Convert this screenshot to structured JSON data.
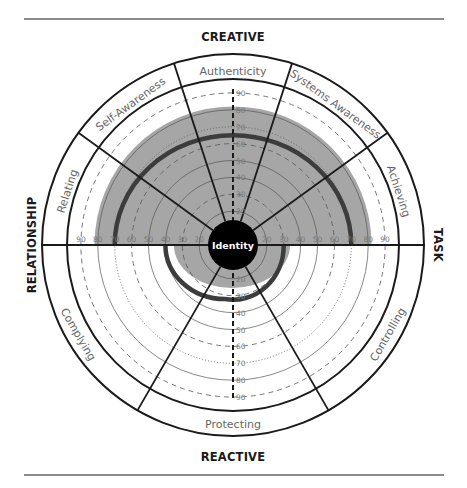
{
  "diagram": {
    "axis_titles": {
      "top": "CREATIVE",
      "bottom": "REACTIVE",
      "left": "RELATIONSHIP",
      "right": "TASK"
    },
    "center_label": "Identity",
    "creative_sectors": [
      "Relating",
      "Self-Awareness",
      "Authenticity",
      "Systems Awareness",
      "Achieving"
    ],
    "reactive_sectors": [
      "Complying",
      "Protecting",
      "Controlling"
    ],
    "scale_ticks": [
      "10",
      "20",
      "30",
      "40",
      "50",
      "60",
      "70",
      "80",
      "90"
    ],
    "colors": {
      "shade": "#a6a6a6",
      "thick_arc": "#3c3c3c",
      "line": "#1a1a1a",
      "identity_fill": "#000000"
    }
  },
  "chart_data": {
    "type": "radial",
    "title": "",
    "scale": {
      "min": 0,
      "max": 90,
      "step": 10
    },
    "creative_half": {
      "shaded_score": 82,
      "thick_arc_score": 65,
      "sectors": [
        "Relating",
        "Self-Awareness",
        "Authenticity",
        "Systems Awareness",
        "Achieving"
      ]
    },
    "reactive_half": {
      "shaded_score": 25,
      "thick_arc_score": 32,
      "sectors": [
        "Complying",
        "Protecting",
        "Controlling"
      ]
    }
  }
}
